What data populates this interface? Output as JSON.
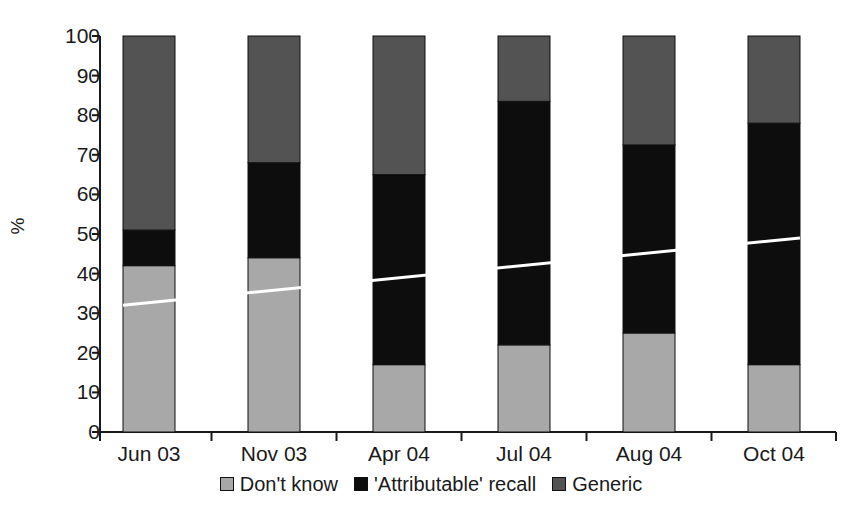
{
  "chart_data": {
    "type": "bar",
    "stacked": true,
    "title": "",
    "subtitle": "",
    "xlabel": "",
    "ylabel": "%",
    "ylim": [
      0,
      100
    ],
    "yticks": [
      0,
      10,
      20,
      30,
      40,
      50,
      60,
      70,
      80,
      90,
      100
    ],
    "ytick_labels": [
      "0",
      "10",
      "20",
      "30",
      "40",
      "50",
      "60",
      "70",
      "80",
      "90",
      "100"
    ],
    "grid": false,
    "legend_position": "bottom",
    "categories": [
      "Jun 03",
      "Nov 03",
      "Apr 04",
      "Jul 04",
      "Aug 04",
      "Oct 04"
    ],
    "series": [
      {
        "name": "Don't know",
        "color": "#a8a8a8",
        "values": [
          42,
          44,
          17,
          22,
          25,
          17
        ]
      },
      {
        "name": "'Attributable' recall",
        "color": "#0d0d0d",
        "values": [
          9,
          24,
          48,
          61.5,
          47.5,
          61
        ]
      },
      {
        "name": "Generic",
        "color": "#535353",
        "values": [
          49,
          32,
          35,
          16.5,
          27.5,
          22
        ]
      }
    ],
    "annotations": [
      {
        "type": "trend-line",
        "name": "trend-line",
        "color": "#ffffff",
        "start": {
          "category": "Jun 03",
          "value": 32
        },
        "end": {
          "category": "Oct 04",
          "value": 49
        }
      }
    ]
  },
  "legend": {
    "items": [
      {
        "label": "Don't know",
        "swatch": "#a8a8a8"
      },
      {
        "label": "'Attributable' recall",
        "swatch": "#0d0d0d"
      },
      {
        "label": "Generic",
        "swatch": "#535353"
      }
    ]
  }
}
